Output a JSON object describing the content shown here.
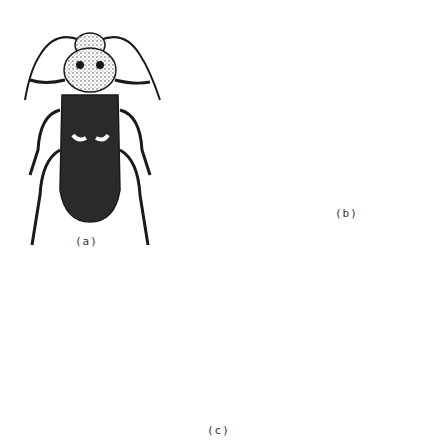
{
  "figure": {
    "labels": {
      "a": "(a)",
      "b": "(b)",
      "c": "(c)"
    },
    "specimens": [
      {
        "id": "a",
        "name": "long-horned beetle adult (dark, with pale elytral marks)"
      },
      {
        "id": "a-larva",
        "name": "flat-headed larva"
      },
      {
        "id": "b",
        "name": "slender beetle adult (striated elytra)"
      },
      {
        "id": "b-larva",
        "name": "wireworm-like larva"
      },
      {
        "id": "c",
        "name": "weevil adult"
      },
      {
        "id": "c-larva",
        "name": "curved grub larva"
      }
    ],
    "colors": {
      "ink": "#1a1a1a",
      "dark_body": "#2a2a2a",
      "paper": "#ffffff"
    }
  }
}
